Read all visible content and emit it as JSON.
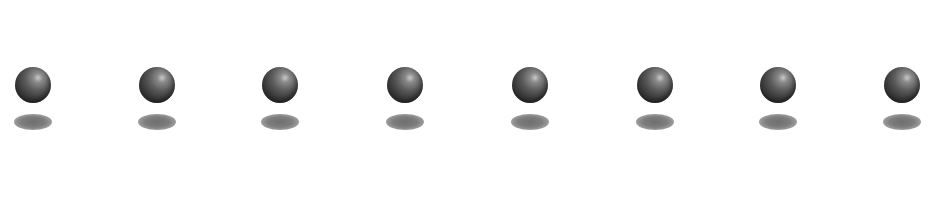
{
  "scene": {
    "background": "#ffffff",
    "sphere_color": "#3a3a3a",
    "highlight_color": "#c9c9c9",
    "shadow_color": "#777777",
    "items": [
      {
        "x": 13
      },
      {
        "x": 137
      },
      {
        "x": 260
      },
      {
        "x": 385
      },
      {
        "x": 510
      },
      {
        "x": 635
      },
      {
        "x": 758
      },
      {
        "x": 882
      }
    ]
  }
}
